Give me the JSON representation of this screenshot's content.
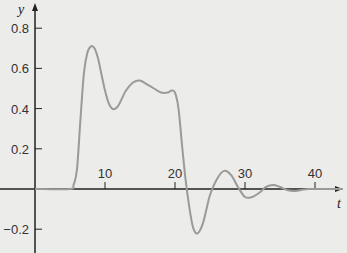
{
  "chart_data": {
    "type": "line",
    "title": "",
    "xlabel": "t",
    "ylabel": "y",
    "xlim": [
      0,
      44
    ],
    "ylim": [
      -0.26,
      0.88
    ],
    "grid": false,
    "x_ticks": [
      10,
      20,
      30,
      40
    ],
    "y_ticks": [
      -0.2,
      0.2,
      0.4,
      0.6,
      0.8
    ],
    "x_tick_labels": [
      "10",
      "20",
      "30",
      "40"
    ],
    "y_tick_labels": [
      "-0.2",
      "0.2",
      "0.4",
      "0.6",
      "0.8"
    ],
    "series": [
      {
        "name": "y(t)",
        "color": "#9a9a9a",
        "x": [
          0,
          5,
          5.5,
          6,
          6.5,
          7,
          7.5,
          8,
          8.5,
          9,
          9.5,
          10,
          10.5,
          11,
          11.5,
          12,
          13,
          14,
          15,
          16,
          17,
          18,
          19,
          19.5,
          20,
          20.5,
          21,
          21.5,
          22,
          22.5,
          23,
          23.5,
          24,
          24.5,
          25,
          26,
          27,
          28,
          29,
          30,
          31,
          32,
          33,
          34,
          35,
          36,
          37,
          38,
          39,
          40,
          44
        ],
        "y": [
          0,
          0,
          0.02,
          0.1,
          0.35,
          0.58,
          0.68,
          0.71,
          0.7,
          0.65,
          0.57,
          0.49,
          0.43,
          0.4,
          0.4,
          0.42,
          0.49,
          0.53,
          0.54,
          0.52,
          0.5,
          0.48,
          0.48,
          0.49,
          0.48,
          0.4,
          0.22,
          0.05,
          -0.08,
          -0.18,
          -0.22,
          -0.21,
          -0.17,
          -0.1,
          -0.03,
          0.05,
          0.09,
          0.07,
          0.01,
          -0.04,
          -0.04,
          -0.02,
          0.01,
          0.02,
          0.01,
          -0.005,
          -0.01,
          -0.005,
          0.0,
          0.0,
          0.0
        ]
      }
    ]
  }
}
